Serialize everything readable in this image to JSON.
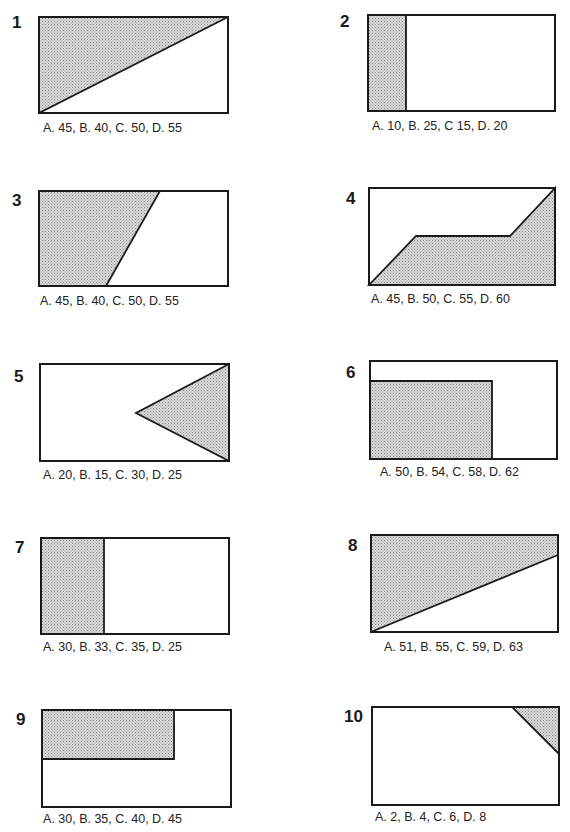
{
  "worksheet": {
    "instruction": "",
    "colors": {
      "ink": "#1a1a1a",
      "shade_base": "#d9d9d9",
      "shade_dot": "#8a8a8a",
      "paper": "#ffffff"
    },
    "questions": [
      {
        "number": "1",
        "shape": "triangle-upper-left-half",
        "options": "A. 45, B. 40, C. 50, D. 55"
      },
      {
        "number": "2",
        "shape": "left-vertical-strip",
        "options": "A. 10, B. 25, C 15, D. 20"
      },
      {
        "number": "3",
        "shape": "left-trapezoid",
        "options": "A. 45, B. 40, C. 50, D. 55"
      },
      {
        "number": "4",
        "shape": "bottom-stepped-polygon",
        "options": "A. 45, B. 50, C. 55, D. 60"
      },
      {
        "number": "5",
        "shape": "right-triangle-pointing-left",
        "options": "A. 20, B. 15, C. 30, D. 25"
      },
      {
        "number": "6",
        "shape": "bottom-left-rectangle",
        "options": "A. 50, B. 54, C. 58, D. 62"
      },
      {
        "number": "7",
        "shape": "left-vertical-strip",
        "options": "A. 30, B. 33, C. 35, D. 25"
      },
      {
        "number": "8",
        "shape": "upper-trapezoid-diagonal",
        "options": "A. 51, B. 55, C. 59, D. 63"
      },
      {
        "number": "9",
        "shape": "top-left-rectangle",
        "options": "A. 30, B. 35, C. 40, D. 45"
      },
      {
        "number": "10",
        "shape": "top-right-corner-triangle",
        "options": "A. 2, B. 4, C. 6, D. 8"
      }
    ]
  }
}
